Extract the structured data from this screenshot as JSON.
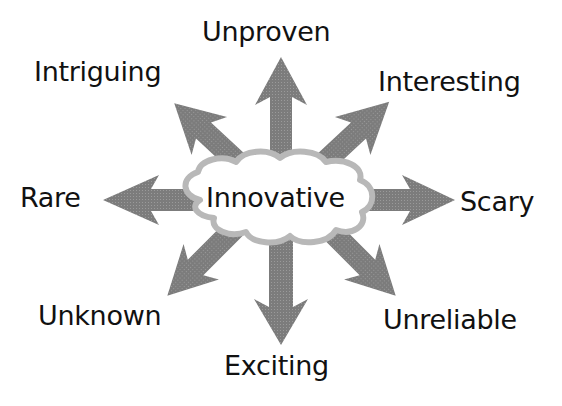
{
  "diagram": {
    "type": "radial-concept-map",
    "center": {
      "label": "Innovative",
      "shape": "cloud"
    },
    "branches": [
      {
        "id": "unproven",
        "label": "Unproven",
        "direction": "up"
      },
      {
        "id": "interesting",
        "label": "Interesting",
        "direction": "up-right"
      },
      {
        "id": "scary",
        "label": "Scary",
        "direction": "right"
      },
      {
        "id": "unreliable",
        "label": "Unreliable",
        "direction": "down-right"
      },
      {
        "id": "exciting",
        "label": "Exciting",
        "direction": "down"
      },
      {
        "id": "unknown",
        "label": "Unknown",
        "direction": "down-left"
      },
      {
        "id": "rare",
        "label": "Rare",
        "direction": "left"
      },
      {
        "id": "intriguing",
        "label": "Intriguing",
        "direction": "up-left"
      }
    ],
    "colors": {
      "arrow_fill": "#808080",
      "cloud_outline": "#b8b8b8",
      "cloud_fill": "#ffffff",
      "text": "#111111",
      "background": "#ffffff"
    }
  }
}
